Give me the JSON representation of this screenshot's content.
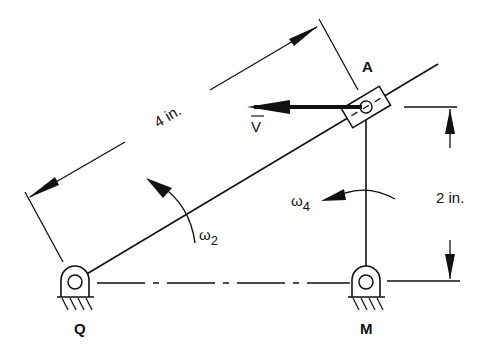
{
  "diagram": {
    "labels": {
      "point_a": "A",
      "point_q": "Q",
      "point_m": "M",
      "velocity": "V",
      "omega2": "ω",
      "omega2_sub": "2",
      "omega4": "ω",
      "omega4_sub": "4",
      "dim_length": "4 in.",
      "dim_height": "2 in."
    },
    "colors": {
      "ink": "#111111",
      "background": "#ffffff"
    }
  }
}
